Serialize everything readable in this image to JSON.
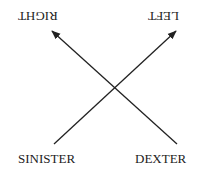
{
  "diagram": {
    "labels": {
      "top_left": "RIGHT",
      "top_right": "LEFT",
      "bottom_left": "SINISTER",
      "bottom_right": "DEXTER"
    },
    "top_labels_orientation": "rotated 180 degrees (upside-down)",
    "arrows": [
      {
        "from": "SINISTER",
        "to": "LEFT",
        "direction": "up-right"
      },
      {
        "from": "DEXTER",
        "to": "RIGHT",
        "direction": "up-left"
      }
    ],
    "colors": {
      "line": "#222222",
      "text": "#222222",
      "background": "#ffffff"
    }
  }
}
